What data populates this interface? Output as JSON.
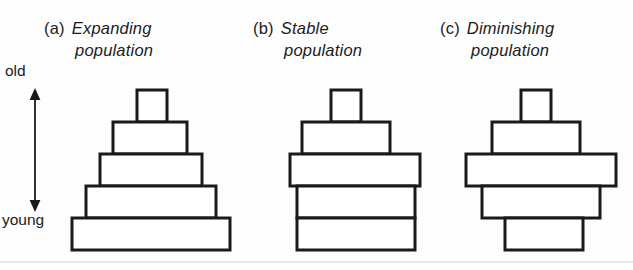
{
  "figure": {
    "title_visible": false,
    "background_color": "#fdfdfd",
    "outline_color": "#1a1a1a",
    "fill_color": "#ffffff"
  },
  "axis": {
    "name": "age-axis",
    "top_label": "old",
    "bottom_label": "young",
    "arrow_style": "double-headed-vertical",
    "arrow_icon": "double-arrow-vertical-icon"
  },
  "panels": [
    {
      "id": "a",
      "tag": "(a)",
      "title_line1": "Expanding",
      "title_line2": "population",
      "shape": "broad-based-pyramid"
    },
    {
      "id": "b",
      "tag": "(b)",
      "title_line1": "Stable",
      "title_line2": "population",
      "shape": "bell-straight-sided"
    },
    {
      "id": "c",
      "tag": "(c)",
      "title_line1": "Diminishing",
      "title_line2": "population",
      "shape": "narrow-based-diamond"
    }
  ],
  "chart_data": {
    "type": "bar",
    "xlabel": "",
    "ylabel": "Age",
    "categories": [
      "young",
      "2",
      "3",
      "4",
      "old"
    ],
    "tick_labels": [
      "young",
      "old"
    ],
    "grid": false,
    "legend_position": "none",
    "tier_count": 5,
    "tier_height_px": 32,
    "series": [
      {
        "name": "Expanding population",
        "values": [
          158,
          130,
          102,
          74,
          30
        ]
      },
      {
        "name": "Stable population",
        "values": [
          118,
          118,
          130,
          88,
          30
        ]
      },
      {
        "name": "Diminishing population",
        "values": [
          78,
          118,
          150,
          88,
          30
        ]
      }
    ],
    "panel_geometry": [
      {
        "panel": "a",
        "tiers": [
          {
            "index": 1,
            "age": "old",
            "x": 79,
            "width": 30,
            "y": 4,
            "height": 32
          },
          {
            "index": 2,
            "age": "4",
            "x": 55,
            "width": 74,
            "y": 36,
            "height": 32
          },
          {
            "index": 3,
            "age": "3",
            "x": 42,
            "width": 102,
            "y": 68,
            "height": 32
          },
          {
            "index": 4,
            "age": "2",
            "x": 28,
            "width": 130,
            "y": 100,
            "height": 32
          },
          {
            "index": 5,
            "age": "young",
            "x": 14,
            "width": 158,
            "y": 132,
            "height": 32
          }
        ]
      },
      {
        "panel": "b",
        "tiers": [
          {
            "index": 1,
            "age": "old",
            "x": 59,
            "width": 30,
            "y": 4,
            "height": 32
          },
          {
            "index": 2,
            "age": "4",
            "x": 30,
            "width": 88,
            "y": 36,
            "height": 32
          },
          {
            "index": 3,
            "age": "3",
            "x": 18,
            "width": 130,
            "y": 68,
            "height": 32
          },
          {
            "index": 4,
            "age": "2",
            "x": 25,
            "width": 118,
            "y": 100,
            "height": 32
          },
          {
            "index": 5,
            "age": "young",
            "x": 25,
            "width": 118,
            "y": 132,
            "height": 32
          }
        ]
      },
      {
        "panel": "c",
        "tiers": [
          {
            "index": 1,
            "age": "old",
            "x": 71,
            "width": 30,
            "y": 4,
            "height": 32
          },
          {
            "index": 2,
            "age": "4",
            "x": 42,
            "width": 88,
            "y": 36,
            "height": 32
          },
          {
            "index": 3,
            "age": "3",
            "x": 16,
            "width": 150,
            "y": 68,
            "height": 32
          },
          {
            "index": 4,
            "age": "2",
            "x": 32,
            "width": 118,
            "y": 100,
            "height": 32
          },
          {
            "index": 5,
            "age": "young",
            "x": 55,
            "width": 78,
            "y": 132,
            "height": 32
          }
        ]
      }
    ]
  }
}
